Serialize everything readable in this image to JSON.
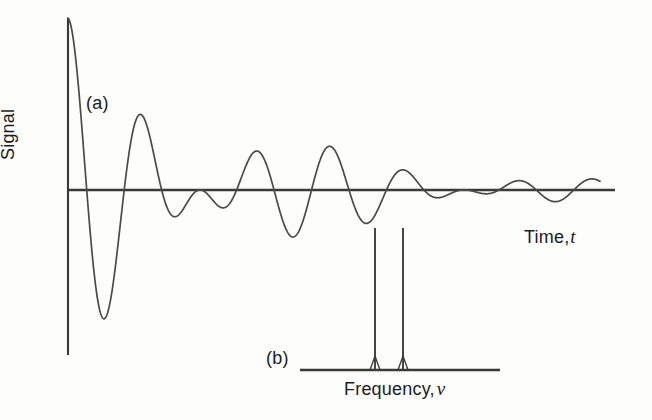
{
  "figure": {
    "panels": [
      {
        "id": "a",
        "label": "(a)",
        "description": "time-domain damped beat signal"
      },
      {
        "id": "b",
        "label": "(b)",
        "description": "frequency-domain spectrum with two lines"
      }
    ],
    "axis_labels": {
      "signal": "Signal",
      "time": "Time,",
      "time_variable": "t",
      "frequency": "Frequency,",
      "frequency_variable": "ν"
    },
    "colors": {
      "background": "#fdfdfc",
      "curve": "#4a4a4a",
      "axis": "#3a3a3a",
      "text": "#1c1c1c"
    }
  },
  "chart_data": [
    {
      "type": "line",
      "panel": "a",
      "title": "",
      "xlabel": "Time, t",
      "ylabel": "Signal",
      "grid": false,
      "legend": null,
      "axis_origin_px": {
        "x": 68,
        "y": 190
      },
      "xlim": [
        0,
        1
      ],
      "ylim": [
        -1.05,
        1.05
      ],
      "description": "Free induction decay: sum of two exponentially damped cosines of slightly different frequency, producing a beat pattern with amplitude nodes.",
      "model": {
        "form": "y(t) = exp(-t/T2) * [ cos(2*pi*f1*t) + cos(2*pi*f2*t) ] / 2",
        "T2_normalized": 0.36,
        "f1_cycles_over_span": 8.1,
        "f2_cycles_over_span": 6.1,
        "beat_nodes_normalized_x": [
          0.335,
          0.68
        ],
        "samples": 1400
      },
      "features": {
        "initial_amplitude": 1.0,
        "first_max_x": 0.0,
        "first_max_y": 1.0,
        "first_min_x": 0.062,
        "first_min_y": -0.935,
        "second_max_x": 0.122,
        "second_max_y": 0.772,
        "decay_tail_y": 0.04
      }
    },
    {
      "type": "bar",
      "panel": "b",
      "title": "",
      "xlabel": "Frequency, ν",
      "ylabel": "",
      "grid": false,
      "legend": null,
      "baseline_px": {
        "y": 370,
        "x_start": 300,
        "x_end": 500
      },
      "categories": [
        "ν1",
        "ν2"
      ],
      "values": [
        1.0,
        1.0
      ],
      "peak_positions_px": [
        375,
        403
      ],
      "peak_top_px": 228,
      "description": "Fourier transform of the beat signal: two sharp lines of equal intensity at closely spaced frequencies."
    }
  ]
}
